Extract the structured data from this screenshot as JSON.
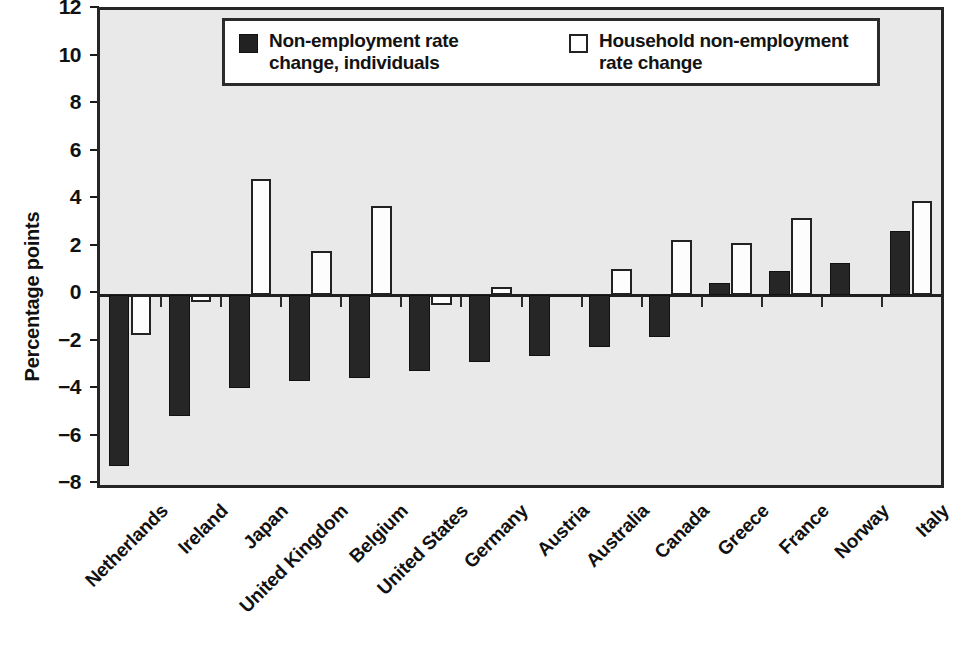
{
  "chart_data": {
    "type": "bar",
    "title": "",
    "xlabel": "",
    "ylabel": "Percentage points",
    "ylim": [
      -8,
      12
    ],
    "yticks": [
      12,
      10,
      8,
      6,
      4,
      2,
      0,
      -2,
      -4,
      -6,
      -8
    ],
    "ytick_labels": [
      "12",
      "10",
      "8",
      "6",
      "4",
      "2",
      "0",
      "−2",
      "−4",
      "−6",
      "−8"
    ],
    "grid": false,
    "legend_position": "top-center",
    "categories": [
      "Netherlands",
      "Ireland",
      "Japan",
      "United Kingdom",
      "Belgium",
      "United States",
      "Germany",
      "Austria",
      "Australia",
      "Canada",
      "Greece",
      "France",
      "Norway",
      "Italy"
    ],
    "series": [
      {
        "name": "Non-employment rate change, individuals",
        "color": "#262626",
        "style": "filled",
        "values": [
          -7.2,
          -5.1,
          -3.9,
          -3.6,
          -3.5,
          -3.2,
          -2.8,
          -2.55,
          -2.2,
          -1.75,
          0.5,
          1.0,
          1.35,
          2.7
        ]
      },
      {
        "name": "Household non-employment rate change",
        "color": "#ffffff",
        "style": "outlined",
        "values": [
          -1.7,
          -0.3,
          4.9,
          1.85,
          3.75,
          -0.4,
          0.35,
          0.0,
          1.1,
          2.3,
          2.2,
          3.25,
          0.0,
          3.95
        ]
      }
    ]
  },
  "legend": {
    "entries": [
      {
        "swatch": "filled-dark-square",
        "line1": "Non-employment rate",
        "line2": "change, individuals"
      },
      {
        "swatch": "outlined-white-square",
        "line1": "Household non-employment",
        "line2": "rate change"
      }
    ]
  },
  "axis": {
    "y_title": "Percentage points"
  },
  "colors": {
    "plot_background": "#e9e9e9",
    "axis_line": "#262626",
    "series_dark": "#262626",
    "series_light": "#fdfdfd",
    "text": "#111111"
  }
}
